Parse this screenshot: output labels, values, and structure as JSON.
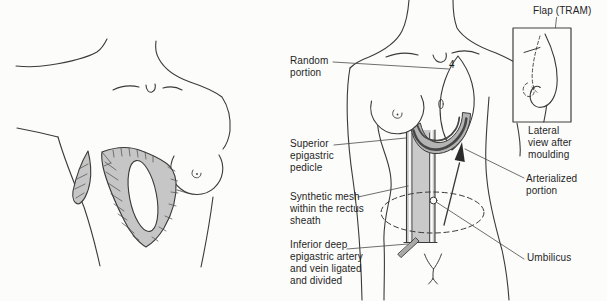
{
  "diagram": {
    "colors": {
      "line": "#3a3a3a",
      "leader": "#4a4a4a",
      "flap_gray": "#c6c6c6",
      "mesh_gray": "#c9c9c9",
      "band_gray": "#b4b4b4",
      "stripe_dark": "#474747",
      "bar_gray": "#a8a8a8",
      "background": "#fcfcfb"
    },
    "labels": {
      "random_portion": "Random portion",
      "superior_epigastric_pedicle": "Superior epigastric pedicle",
      "synthetic_mesh": "Synthetic mesh within the rectus sheath",
      "inferior_deep": "Inferior deep epigastric artery and vein ligated and divided",
      "flap_tram": "Flap (TRAM)",
      "lateral_view": "Lateral view after moulding",
      "arterialized_portion": "Arterialized portion",
      "umbilicus": "Umbilicus",
      "flap_number": "4"
    }
  }
}
